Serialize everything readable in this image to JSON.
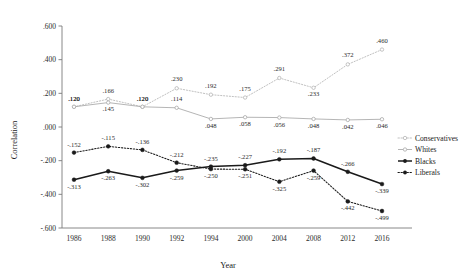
{
  "chart_data": {
    "type": "line",
    "title": "",
    "xlabel": "Year",
    "ylabel": "Correlation",
    "categories": [
      "1986",
      "1988",
      "1990",
      "1992",
      "1994",
      "2000",
      "2004",
      "2008",
      "2012",
      "2016"
    ],
    "ylim": [
      -0.6,
      0.6
    ],
    "yticks": [
      0.6,
      0.4,
      0.2,
      0.0,
      -0.2,
      -0.4,
      -0.6
    ],
    "ytick_labels": [
      ".600",
      ".400",
      ".200",
      ".000",
      "-.200",
      "-.400",
      "-.600"
    ],
    "grid": false,
    "legend_position": "right",
    "series": [
      {
        "name": "Conservatives",
        "style": "dotted-light",
        "color": "#b5b5b5",
        "values": [
          0.12,
          0.166,
          0.12,
          0.23,
          0.192,
          0.175,
          0.291,
          0.233,
          0.372,
          0.46
        ],
        "labels": [
          ".120",
          ".166",
          ".120",
          ".230",
          ".192",
          ".175",
          ".291",
          ".233",
          ".372",
          ".460"
        ]
      },
      {
        "name": "Whites",
        "style": "solid-light",
        "color": "#a8a8a8",
        "values": [
          0.12,
          0.145,
          0.12,
          0.114,
          0.048,
          0.058,
          0.056,
          0.048,
          0.042,
          0.046
        ],
        "labels": [
          ".120",
          ".145",
          ".120",
          ".114",
          ".048",
          ".058",
          ".056",
          ".048",
          ".042",
          ".046"
        ]
      },
      {
        "name": "Blacks",
        "style": "solid-dark",
        "color": "#1a1a1a",
        "values": [
          -0.313,
          -0.263,
          -0.302,
          -0.259,
          -0.235,
          -0.227,
          -0.192,
          -0.187,
          -0.266,
          -0.339
        ],
        "labels": [
          "-.313",
          "-.263",
          "-.302",
          "-.259",
          "-.235",
          "-.227",
          "-.192",
          "-.187",
          "-.266",
          "-.339"
        ]
      },
      {
        "name": "Liberals",
        "style": "dotted-dark",
        "color": "#1a1a1a",
        "values": [
          -0.152,
          -0.115,
          -0.136,
          -0.212,
          -0.25,
          -0.251,
          -0.325,
          -0.259,
          -0.442,
          -0.499
        ],
        "labels": [
          "-.152",
          "-.115",
          "-.136",
          "-.212",
          "-.250",
          "-.251",
          "-.325",
          "-.259",
          "-.442",
          "-.499"
        ]
      }
    ],
    "legend": [
      "Conservatives",
      "Whites",
      "Blacks",
      "Liberals"
    ]
  }
}
